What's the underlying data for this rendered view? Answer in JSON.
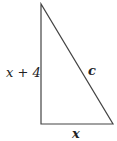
{
  "diagram": {
    "type": "right-triangle",
    "labels": {
      "vertical_side": "x + 4",
      "hypotenuse": "c",
      "base": "x"
    },
    "line_color": "#444444"
  }
}
